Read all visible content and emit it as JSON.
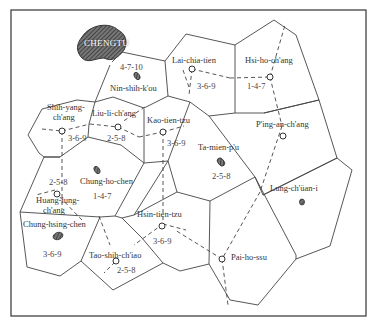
{
  "map": {
    "city": "CHENGTU",
    "markets": [
      {
        "name": "Nin-shih-k'ou",
        "days": "4-7-10"
      },
      {
        "name": "Lai-chia-tien",
        "days": "3-6-9"
      },
      {
        "name": "Hsi-ho-ch'ang",
        "days": "1-4-7"
      },
      {
        "name": "Shih-yang-ch'ang",
        "days": "3-6-9"
      },
      {
        "name": "Liu-li-ch'ang",
        "days": "2-5-8"
      },
      {
        "name": "Kao-tien-tzu",
        "days": "3-6-9"
      },
      {
        "name": "P'ing-an-ch'ang",
        "days": ""
      },
      {
        "name": "Ta-mien-p'u",
        "days": "2-5-8"
      },
      {
        "name": "Chung-ho-chen",
        "days": "1-4-7"
      },
      {
        "name": "Huang-lung-ch'ang",
        "days": "2-5-8"
      },
      {
        "name": "Lung-ch'üan-i",
        "days": ""
      },
      {
        "name": "Chung-hsing-chen",
        "days": "3-6-9"
      },
      {
        "name": "Hsin-tien-tzu",
        "days": "3-6-9"
      },
      {
        "name": "Tao-shih-ch'iao",
        "days": "2-5-8"
      },
      {
        "name": "Pai-ho-ssu",
        "days": ""
      }
    ],
    "labels": {
      "shih_yang_1": "Shih-yang-",
      "shih_yang_2": "ch'ang",
      "huang_lung_1": "Huang-lung-",
      "huang_lung_2": "ch'ang"
    }
  }
}
